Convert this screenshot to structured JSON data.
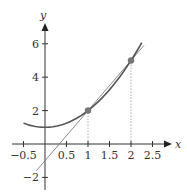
{
  "chart_data": {
    "type": "line",
    "title": "",
    "xlabel": "x",
    "ylabel": "y",
    "xlim": [
      -0.5,
      2.5
    ],
    "ylim": [
      -2,
      6
    ],
    "grid": false,
    "x_ticks": [
      -0.5,
      0.5,
      1,
      1.5,
      2,
      2.5
    ],
    "x_tick_labels": [
      "−0.5",
      "0.5",
      "1",
      "1.5",
      "2",
      "2.5"
    ],
    "y_ticks": [
      -2,
      2,
      4,
      6
    ],
    "y_tick_labels": [
      "−2",
      "2",
      "4",
      "6"
    ],
    "series": [
      {
        "name": "curve",
        "description": "y = x^2 + 1",
        "x": [
          -0.5,
          0,
          0.5,
          1,
          1.5,
          2,
          2.25
        ],
        "y": [
          1.25,
          1,
          1.25,
          2,
          3.25,
          5,
          6.06
        ],
        "color": "#555555"
      },
      {
        "name": "secant line",
        "description": "y = 3x - 1 through (1,2) and (2,5)",
        "x": [
          -0.2,
          2.3
        ],
        "y": [
          -1.6,
          5.9
        ],
        "color": "#8a8a8a"
      }
    ],
    "points": [
      {
        "x": 1,
        "y": 2
      },
      {
        "x": 2,
        "y": 5
      }
    ],
    "annotations": [
      {
        "type": "dotted-vertical",
        "x": 1,
        "from_y": 0,
        "to_y": 2
      },
      {
        "type": "dotted-vertical",
        "x": 2,
        "from_y": 0,
        "to_y": 5
      }
    ]
  }
}
